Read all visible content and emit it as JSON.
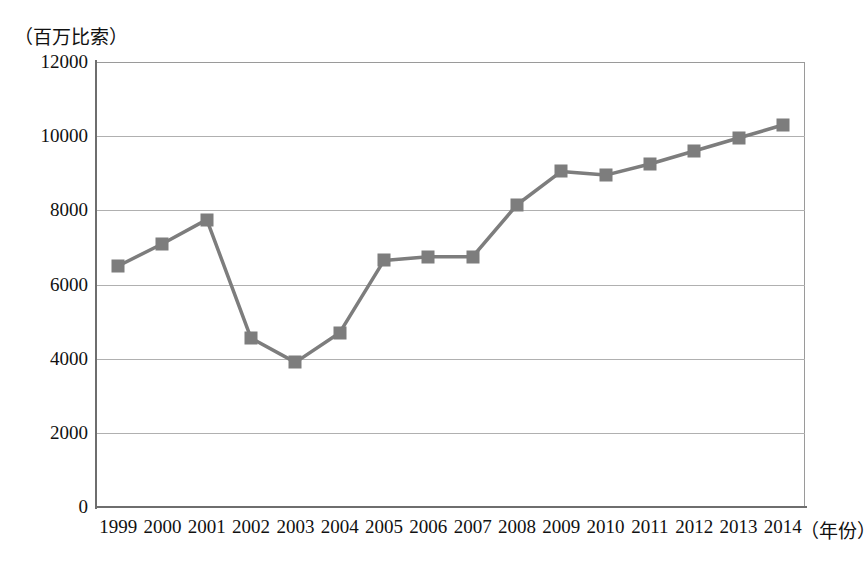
{
  "chart_data": {
    "type": "line",
    "title": "",
    "subtitle": "",
    "xlabel": "（年份）",
    "ylabel": "（百万比索）",
    "categories": [
      "1999",
      "2000",
      "2001",
      "2002",
      "2003",
      "2004",
      "2005",
      "2006",
      "2007",
      "2008",
      "2009",
      "2010",
      "2011",
      "2012",
      "2013",
      "2014"
    ],
    "values": [
      6500,
      7100,
      7750,
      4550,
      3900,
      4700,
      6650,
      6750,
      6750,
      8150,
      9050,
      8950,
      9250,
      9600,
      9950,
      10300
    ],
    "series": [
      {
        "name": "",
        "values": [
          6500,
          7100,
          7750,
          4550,
          3900,
          4700,
          6650,
          6750,
          6750,
          8150,
          9050,
          8950,
          9250,
          9600,
          9950,
          10300
        ]
      }
    ],
    "ylim": [
      0,
      12000
    ],
    "ytick_labels": [
      "0",
      "2000",
      "4000",
      "6000",
      "8000",
      "10000",
      "12000"
    ],
    "ytick_values": [
      0,
      2000,
      4000,
      6000,
      8000,
      10000,
      12000
    ],
    "xtick_labels": [
      "1999",
      "2000",
      "2001",
      "2002",
      "2003",
      "2004",
      "2005",
      "2006",
      "2007",
      "2008",
      "2009",
      "2010",
      "2011",
      "2012",
      "2013",
      "2014"
    ],
    "grid": true,
    "legend": "none",
    "marker": "square",
    "series_color": "#7d7d7d",
    "grid_color": "#b0b0b0",
    "axis_color": "#6e6e6e"
  }
}
